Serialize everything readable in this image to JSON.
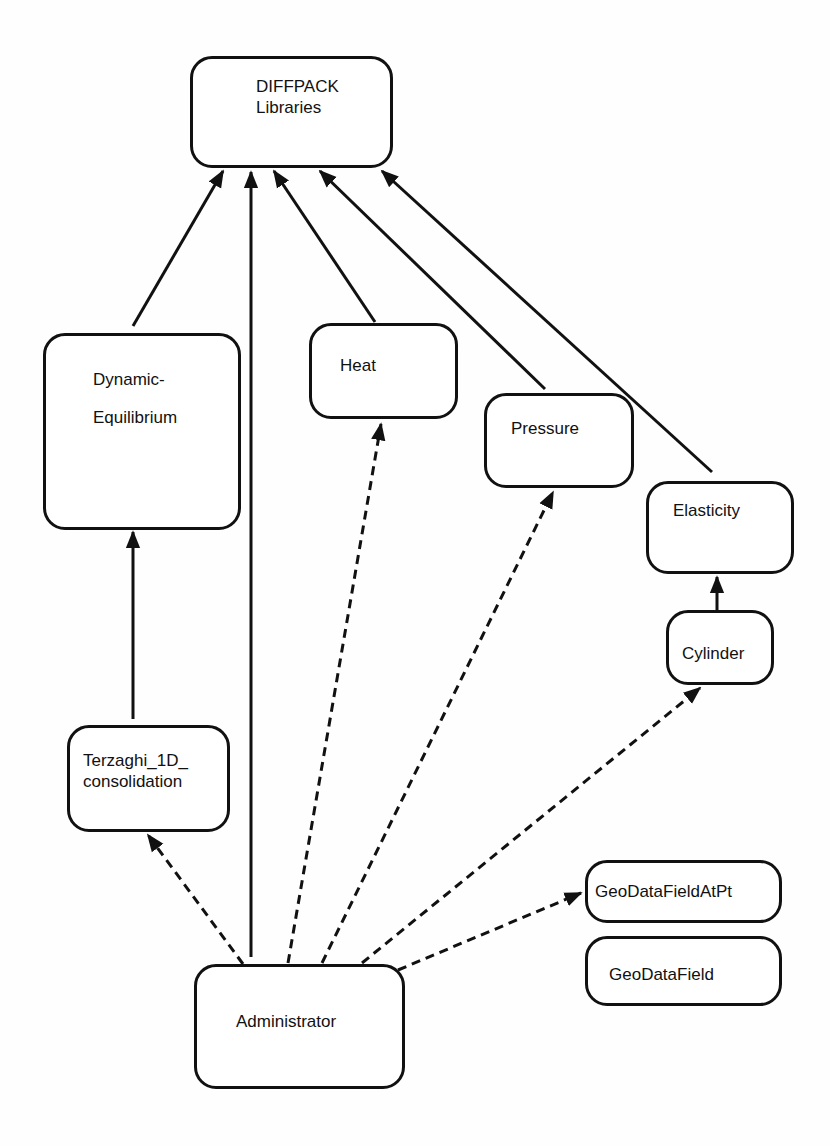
{
  "diagram": {
    "nodes": {
      "diffpack": {
        "label": "DIFFPACK\nLibraries"
      },
      "dynamic": {
        "label": "Dynamic-\n\nEquilibrium"
      },
      "heat": {
        "label": "Heat"
      },
      "pressure": {
        "label": "Pressure"
      },
      "elasticity": {
        "label": "Elasticity"
      },
      "cylinder": {
        "label": "Cylinder"
      },
      "terzaghi": {
        "label": "Terzaghi_1D_\nconsolidation"
      },
      "geodatafieldatpt": {
        "label": "GeoDataFieldAtPt"
      },
      "geodatafield": {
        "label": "GeoDataField"
      },
      "administrator": {
        "label": "Administrator"
      }
    },
    "edges": [
      {
        "from": "Dynamic-Equilibrium",
        "to": "DIFFPACK Libraries",
        "style": "solid"
      },
      {
        "from": "Administrator",
        "to": "DIFFPACK Libraries",
        "style": "solid"
      },
      {
        "from": "Heat",
        "to": "DIFFPACK Libraries",
        "style": "solid"
      },
      {
        "from": "Pressure",
        "to": "DIFFPACK Libraries",
        "style": "solid"
      },
      {
        "from": "Elasticity",
        "to": "DIFFPACK Libraries",
        "style": "solid"
      },
      {
        "from": "Terzaghi_1D_consolidation",
        "to": "Dynamic-Equilibrium",
        "style": "solid"
      },
      {
        "from": "Cylinder",
        "to": "Elasticity",
        "style": "solid"
      },
      {
        "from": "Administrator",
        "to": "Terzaghi_1D_consolidation",
        "style": "dashed"
      },
      {
        "from": "Administrator",
        "to": "Heat",
        "style": "dashed"
      },
      {
        "from": "Administrator",
        "to": "Pressure",
        "style": "dashed"
      },
      {
        "from": "Administrator",
        "to": "Cylinder",
        "style": "dashed"
      },
      {
        "from": "Administrator",
        "to": "GeoDataFieldAtPt",
        "style": "dashed"
      }
    ],
    "colors": {
      "stroke": "#111111",
      "background": "#ffffff"
    }
  }
}
